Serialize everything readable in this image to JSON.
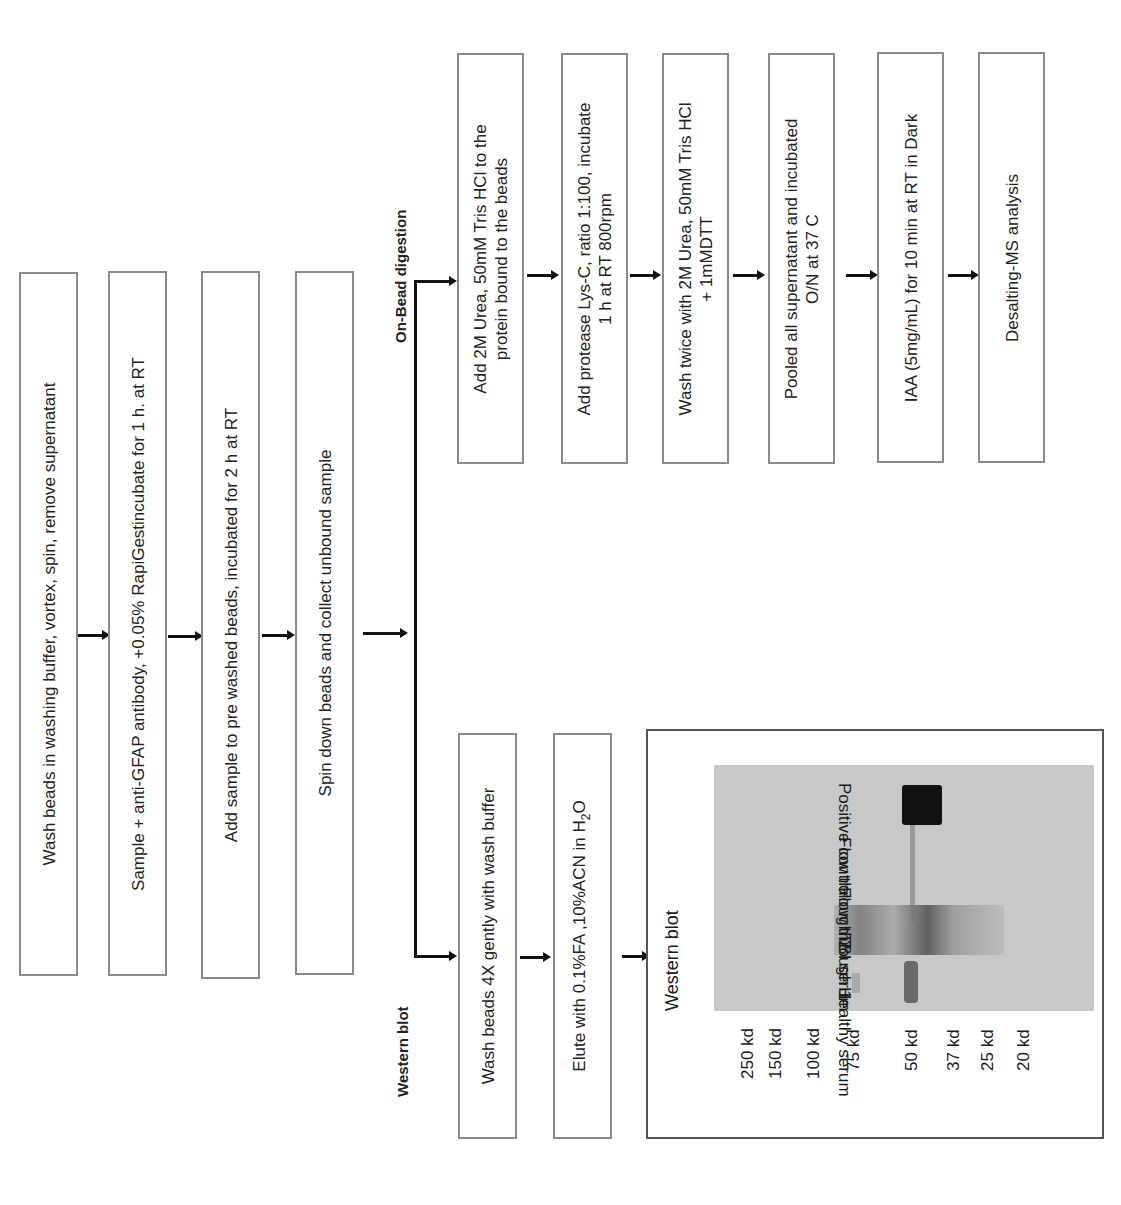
{
  "main_steps": [
    "Wash beads in washing buffer, vortex, spin, remove supernatant",
    "Sample + anti-GFAP antibody, +0.05% RapiGestincubate for 1 h. at RT",
    "Add sample to pre washed beads, incubated for 2 h at RT",
    "Spin down beads and collect unbound sample"
  ],
  "branches": {
    "on_bead": {
      "title": "On-Bead digestion",
      "steps": [
        {
          "line1": "Add 2M Urea, 50mM Tris HCl to the",
          "line2": "protein bound to the beads"
        },
        {
          "line1": "Add protease Lys-C, ratio 1:100, incubate",
          "line2": "1 h at RT 800rpm"
        },
        {
          "line1": "Wash twice with 2M Urea, 50mM Tris HCl",
          "line2": "+ 1mMDTT"
        },
        {
          "line1": "Pooled all supernatant and incubated",
          "line2": "O/N at 37 C"
        },
        {
          "line1": "IAA (5mg/mL) for 10 min at RT in Dark",
          "line2": ""
        },
        {
          "line1": "Desalting-MS analysis",
          "line2": ""
        }
      ]
    },
    "western": {
      "title": "Western blot",
      "steps": [
        "Wash beads 4X gently with wash buffer",
        "Elute with 0.1%FA ,10%ACN in H",
        "2",
        "O"
      ],
      "panel": {
        "title": "Western blot",
        "lanes": [
          "Healthy serum",
          "TBI serum",
          "Flow through 1",
          "Flow through 2",
          "Positive control"
        ],
        "markers": [
          "250 kd",
          "150 kd",
          "100 kd",
          "75 kd",
          "50 kd",
          "37 kd",
          "25 kd",
          "20 kd"
        ]
      }
    }
  }
}
